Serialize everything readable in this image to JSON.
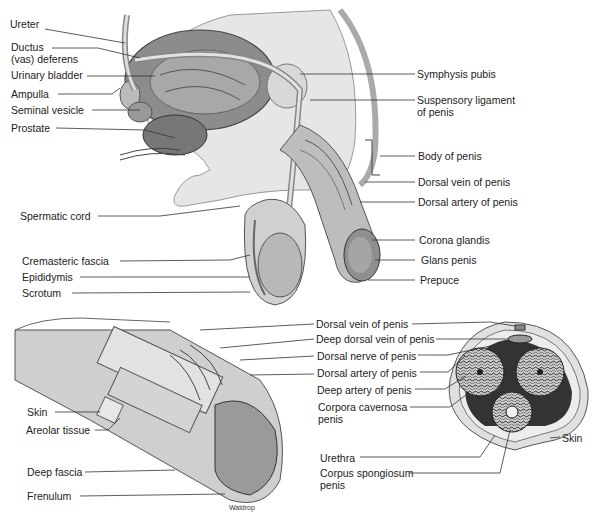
{
  "diagram": {
    "credit": "Waldrop",
    "sagittal_view": {
      "left_labels": [
        {
          "text": "Ureter"
        },
        {
          "text": "Ductus\n(vas) deferens"
        },
        {
          "text": "Urinary bladder"
        },
        {
          "text": "Ampulla"
        },
        {
          "text": "Seminal vesicle"
        },
        {
          "text": "Prostate"
        },
        {
          "text": "Spermatic cord"
        },
        {
          "text": "Cremasteric fascia"
        },
        {
          "text": "Epididymis"
        },
        {
          "text": "Scrotum"
        }
      ],
      "right_labels": [
        {
          "text": "Symphysis pubis"
        },
        {
          "text": "Suspensory ligament\nof penis"
        },
        {
          "text": "Body of penis"
        },
        {
          "text": "Dorsal vein of penis"
        },
        {
          "text": "Dorsal artery of penis"
        },
        {
          "text": "Corona glandis"
        },
        {
          "text": "Glans penis"
        },
        {
          "text": "Prepuce"
        }
      ]
    },
    "dissected_view": {
      "labels": [
        {
          "text": "Skin"
        },
        {
          "text": "Areolar tissue"
        },
        {
          "text": "Deep fascia"
        },
        {
          "text": "Frenulum"
        }
      ]
    },
    "cross_section_view": {
      "labels": [
        {
          "text": "Dorsal vein of penis"
        },
        {
          "text": "Deep dorsal vein of penis"
        },
        {
          "text": "Dorsal nerve of penis"
        },
        {
          "text": "Dorsal artery of penis"
        },
        {
          "text": "Deep artery of penis"
        },
        {
          "text": "Corpora cavernosa\npenis"
        },
        {
          "text": "Urethra"
        },
        {
          "text": "Corpus spongiosum\npenis"
        },
        {
          "text": "Skin"
        }
      ]
    }
  }
}
